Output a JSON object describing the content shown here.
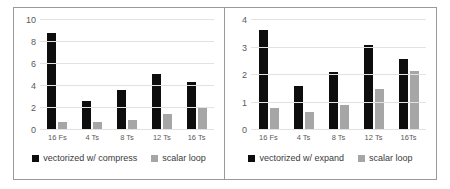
{
  "chart_data": [
    {
      "type": "bar",
      "panel": "left",
      "title": "",
      "xlabel": "",
      "ylabel": "",
      "categories": [
        "16 Fs",
        "4 Ts",
        "8 Ts",
        "12 Ts",
        "16 Ts"
      ],
      "series": [
        {
          "name": "vectorized w/ compress",
          "color": "#0d0d0d",
          "values": [
            8.8,
            2.65,
            3.65,
            5.05,
            4.35
          ]
        },
        {
          "name": "scalar loop",
          "color": "#a6a6a6",
          "values": [
            0.7,
            0.75,
            0.9,
            1.45,
            2.1
          ]
        }
      ],
      "ylim": [
        0,
        10
      ],
      "yticks": [
        0,
        2,
        4,
        6,
        8,
        10
      ],
      "grid": true,
      "legend_position": "bottom"
    },
    {
      "type": "bar",
      "panel": "right",
      "title": "",
      "xlabel": "",
      "ylabel": "",
      "categories": [
        "16 Fs",
        "4 Ts",
        "8 Ts",
        "12 Ts",
        "16Ts"
      ],
      "series": [
        {
          "name": "vectorized w/ expand",
          "color": "#0d0d0d",
          "values": [
            3.62,
            1.6,
            2.12,
            3.08,
            2.58
          ]
        },
        {
          "name": "scalar loop",
          "color": "#a6a6a6",
          "values": [
            0.8,
            0.65,
            0.92,
            1.48,
            2.14
          ]
        }
      ],
      "ylim": [
        0,
        4
      ],
      "yticks": [
        0,
        1,
        2,
        3,
        4
      ],
      "grid": true,
      "legend_position": "bottom"
    }
  ]
}
